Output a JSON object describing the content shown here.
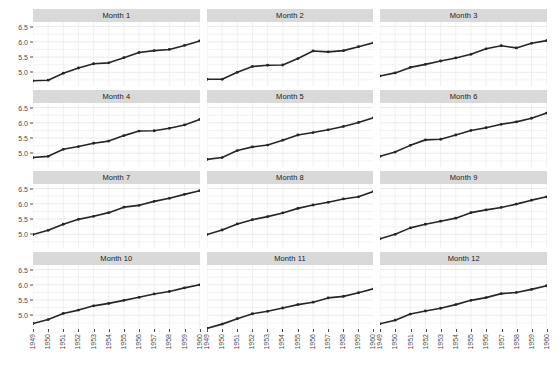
{
  "title": "",
  "chart_data": {
    "type": "line",
    "title": "",
    "xlabel": "",
    "ylabel": "",
    "ylim": [
      4.55,
      6.65
    ],
    "xlim": [
      1949,
      1960
    ],
    "grid": true,
    "legend": "none",
    "facet_layout": {
      "rows": 4,
      "cols": 3
    },
    "y_ticks": [
      "5.0",
      "5.5",
      "6.0",
      "6.5"
    ],
    "y_tick_values": [
      5.0,
      5.5,
      6.0,
      6.5
    ],
    "x_ticks": [
      "1949",
      "1950",
      "1951",
      "1952",
      "1953",
      "1954",
      "1955",
      "1956",
      "1957",
      "1958",
      "1959",
      "1960"
    ],
    "x_tick_values": [
      1949,
      1950,
      1951,
      1952,
      1953,
      1954,
      1955,
      1956,
      1957,
      1958,
      1959,
      1960
    ],
    "series_color": "#262626",
    "panel_background": "#ffffff",
    "grid_color": "#ebebeb",
    "strip_background": "#d9d9d9",
    "panels": [
      {
        "label": "Month 1",
        "x": [
          1949,
          1950,
          1951,
          1952,
          1953,
          1954,
          1955,
          1956,
          1957,
          1958,
          1959,
          1960
        ],
        "values": [
          4.72,
          4.74,
          4.97,
          5.14,
          5.28,
          5.31,
          5.48,
          5.65,
          5.71,
          5.75,
          5.88,
          6.03
        ]
      },
      {
        "label": "Month 2",
        "x": [
          1949,
          1950,
          1951,
          1952,
          1953,
          1954,
          1955,
          1956,
          1957,
          1958,
          1959,
          1960
        ],
        "values": [
          4.77,
          4.77,
          5.0,
          5.19,
          5.23,
          5.24,
          5.45,
          5.7,
          5.67,
          5.71,
          5.84,
          5.97
        ]
      },
      {
        "label": "Month 3",
        "x": [
          1949,
          1950,
          1951,
          1952,
          1953,
          1954,
          1955,
          1956,
          1957,
          1958,
          1959,
          1960
        ],
        "values": [
          4.88,
          4.98,
          5.16,
          5.26,
          5.37,
          5.47,
          5.59,
          5.77,
          5.87,
          5.8,
          5.95,
          6.04
        ]
      },
      {
        "label": "Month 4",
        "x": [
          1949,
          1950,
          1951,
          1952,
          1953,
          1954,
          1955,
          1956,
          1957,
          1958,
          1959,
          1960
        ],
        "values": [
          4.86,
          4.9,
          5.13,
          5.22,
          5.33,
          5.4,
          5.58,
          5.73,
          5.74,
          5.82,
          5.93,
          6.11
        ]
      },
      {
        "label": "Month 5",
        "x": [
          1949,
          1950,
          1951,
          1952,
          1953,
          1954,
          1955,
          1956,
          1957,
          1958,
          1959,
          1960
        ],
        "values": [
          4.8,
          4.86,
          5.09,
          5.21,
          5.27,
          5.43,
          5.6,
          5.68,
          5.77,
          5.88,
          6.01,
          6.17
        ]
      },
      {
        "label": "Month 6",
        "x": [
          1949,
          1950,
          1951,
          1952,
          1953,
          1954,
          1955,
          1956,
          1957,
          1958,
          1959,
          1960
        ],
        "values": [
          4.9,
          5.04,
          5.26,
          5.44,
          5.46,
          5.6,
          5.75,
          5.84,
          5.95,
          6.03,
          6.15,
          6.32
        ]
      },
      {
        "label": "Month 7",
        "x": [
          1949,
          1950,
          1951,
          1952,
          1953,
          1954,
          1955,
          1956,
          1957,
          1958,
          1959,
          1960
        ],
        "values": [
          4.99,
          5.13,
          5.33,
          5.49,
          5.59,
          5.71,
          5.89,
          5.95,
          6.08,
          6.18,
          6.31,
          6.43
        ]
      },
      {
        "label": "Month 8",
        "x": [
          1949,
          1950,
          1951,
          1952,
          1953,
          1954,
          1955,
          1956,
          1957,
          1958,
          1959,
          1960
        ],
        "values": [
          4.99,
          5.14,
          5.34,
          5.48,
          5.58,
          5.7,
          5.85,
          5.96,
          6.05,
          6.16,
          6.23,
          6.41
        ]
      },
      {
        "label": "Month 9",
        "x": [
          1949,
          1950,
          1951,
          1952,
          1953,
          1954,
          1955,
          1956,
          1957,
          1958,
          1959,
          1960
        ],
        "values": [
          4.85,
          5.0,
          5.21,
          5.33,
          5.43,
          5.53,
          5.71,
          5.8,
          5.88,
          5.99,
          6.12,
          6.23
        ]
      },
      {
        "label": "Month 10",
        "x": [
          1949,
          1950,
          1951,
          1952,
          1953,
          1954,
          1955,
          1956,
          1957,
          1958,
          1959,
          1960
        ],
        "values": [
          4.73,
          4.86,
          5.06,
          5.17,
          5.31,
          5.39,
          5.49,
          5.59,
          5.7,
          5.78,
          5.9,
          6.0
        ]
      },
      {
        "label": "Month 11",
        "x": [
          1949,
          1950,
          1951,
          1952,
          1953,
          1954,
          1955,
          1956,
          1957,
          1958,
          1959,
          1960
        ],
        "values": [
          4.57,
          4.71,
          4.89,
          5.05,
          5.13,
          5.24,
          5.35,
          5.43,
          5.57,
          5.62,
          5.74,
          5.87
        ]
      },
      {
        "label": "Month 12",
        "x": [
          1949,
          1950,
          1951,
          1952,
          1953,
          1954,
          1955,
          1956,
          1957,
          1958,
          1959,
          1960
        ],
        "values": [
          4.72,
          4.84,
          5.04,
          5.14,
          5.23,
          5.35,
          5.49,
          5.58,
          5.71,
          5.75,
          5.85,
          5.97
        ]
      }
    ]
  }
}
